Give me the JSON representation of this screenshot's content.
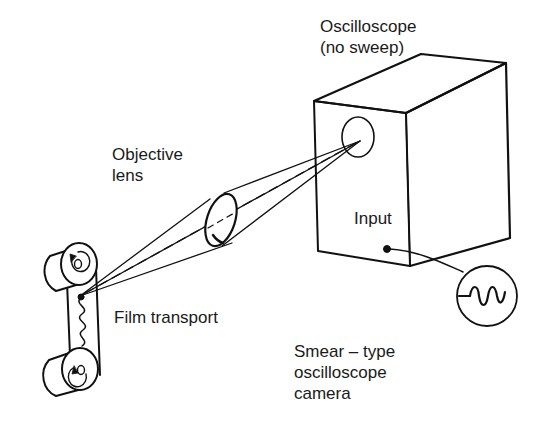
{
  "diagram": {
    "labels": {
      "oscilloscope_line1": "Oscilloscope",
      "oscilloscope_line2": "(no sweep)",
      "objective_line1": "Objective",
      "objective_line2": "lens",
      "input": "Input",
      "film_transport": "Film transport",
      "caption_line1": "Smear – type",
      "caption_line2": "oscilloscope",
      "caption_line3": "camera"
    },
    "components": [
      {
        "name": "oscilloscope-box",
        "kind": "3d-box"
      },
      {
        "name": "oscilloscope-screen",
        "kind": "circle"
      },
      {
        "name": "objective-lens",
        "kind": "ellipse"
      },
      {
        "name": "film-transport",
        "kind": "two-rollers-with-film"
      },
      {
        "name": "input-terminal",
        "kind": "dot"
      },
      {
        "name": "input-signal",
        "kind": "circle-with-sine-wave"
      }
    ],
    "colors": {
      "line": "#111111",
      "background": "#ffffff"
    }
  }
}
